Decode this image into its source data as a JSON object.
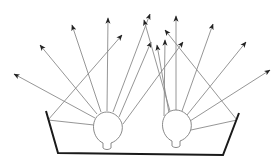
{
  "diagram": {
    "colors": {
      "ray": "#8a8a8a",
      "bulb_outline": "#7a7a7a",
      "tray": "#1a1a1a",
      "arrowhead": "#222222"
    },
    "bulbs": [
      {
        "name": "left-bulb",
        "cx": 107,
        "cy": 128,
        "r": 16
      },
      {
        "name": "right-bulb",
        "cx": 176,
        "cy": 126,
        "r": 16
      }
    ],
    "tray": {
      "points": [
        [
          46,
          111
        ],
        [
          58,
          153
        ],
        [
          223,
          155
        ],
        [
          239,
          113
        ]
      ]
    },
    "rays": [
      {
        "from": [
          95,
          118
        ],
        "to": [
          14,
          74
        ]
      },
      {
        "from": [
          97,
          114
        ],
        "to": [
          40,
          45
        ]
      },
      {
        "from": [
          101,
          112
        ],
        "to": [
          72,
          25
        ]
      },
      {
        "from": [
          107,
          111
        ],
        "to": [
          108,
          18
        ]
      },
      {
        "from": [
          113,
          112
        ],
        "to": [
          150,
          14
        ]
      },
      {
        "from": [
          119,
          117
        ],
        "to": [
          151,
          42
        ]
      },
      {
        "from": [
          123,
          124
        ],
        "to": [
          183,
          42
        ]
      },
      {
        "from": [
          48,
          120
        ],
        "to": [
          122,
          35
        ]
      },
      {
        "from": [
          94,
          125
        ],
        "to": [
          48,
          120
        ]
      },
      {
        "from": [
          164,
          116
        ],
        "to": [
          165,
          40
        ]
      },
      {
        "from": [
          170,
          111
        ],
        "to": [
          144,
          20
        ]
      },
      {
        "from": [
          176,
          110
        ],
        "to": [
          176,
          16
        ]
      },
      {
        "from": [
          182,
          111
        ],
        "to": [
          213,
          24
        ]
      },
      {
        "from": [
          187,
          115
        ],
        "to": [
          246,
          42
        ]
      },
      {
        "from": [
          190,
          121
        ],
        "to": [
          270,
          70
        ]
      },
      {
        "from": [
          191,
          130
        ],
        "to": [
          237,
          120
        ]
      },
      {
        "from": [
          237,
          120
        ],
        "to": [
          165,
          30
        ]
      },
      {
        "from": [
          169,
          113
        ],
        "to": [
          157,
          45
        ]
      }
    ]
  }
}
